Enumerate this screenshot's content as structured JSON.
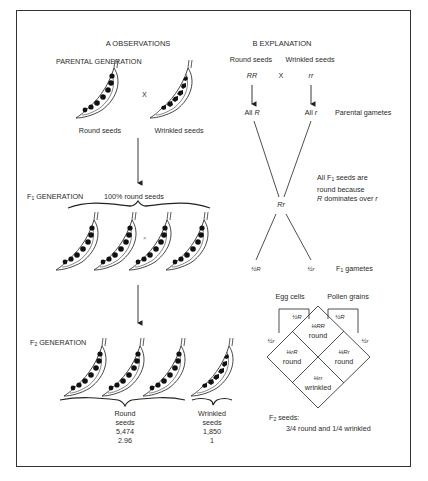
{
  "panel_a": {
    "title": "A   OBSERVATIONS",
    "parental_generation": "PARENTAL GENERATION",
    "cross_symbol": "X",
    "parent_left_label": "Round seeds",
    "parent_right_label": "Wrinkled seeds",
    "f1_label_prefix": "F",
    "f1_label_sub": "1",
    "f1_label_suffix": " GENERATION",
    "f1_note": "100% round seeds",
    "f1_cross_symbol": "×",
    "f2_label_prefix": "F",
    "f2_label_sub": "2",
    "f2_label_suffix": " GENERATION",
    "f2_round": {
      "line1": "Round",
      "line2": "seeds",
      "count": "5,474",
      "ratio": "2.96"
    },
    "f2_wrinkled": {
      "line1": "Wrinkled",
      "line2": "seeds",
      "count": "1,850",
      "ratio": "1"
    }
  },
  "panel_b": {
    "title": "B   EXPLANATION",
    "parent_left_label": "Round seeds",
    "parent_right_label": "Wrinkled seeds",
    "genotype_left": "RR",
    "cross_symbol": "X",
    "genotype_right": "rr",
    "gamete_left_prefix": "All ",
    "gamete_left_allele": "R",
    "gamete_right_prefix": "All ",
    "gamete_right_allele": "r",
    "parental_gametes": "Parental gametes",
    "f1_genotype": "Rr",
    "note_line1_prefix": "All F",
    "note_line1_sub": "1",
    "note_line1_suffix": " seeds are",
    "note_line2": "round because",
    "note_line3_allele1": "R",
    "note_line3_middle": " dominates over ",
    "note_line3_allele2": "r",
    "f1_gamete_left": "½R",
    "f1_gamete_right": "½r",
    "f1_gametes_prefix": "F",
    "f1_gametes_sub": "1",
    "f1_gametes_suffix": " gametes",
    "punnett": {
      "egg_cells": "Egg cells",
      "pollen_grains": "Pollen grains",
      "egg_R": "½R",
      "egg_r": "½r",
      "pollen_R": "½R",
      "pollen_r": "½r",
      "cells": [
        {
          "genotype": "¼RR",
          "phenotype": "round"
        },
        {
          "genotype": "¼rR",
          "phenotype": "round"
        },
        {
          "genotype": "¼Rr",
          "phenotype": "round"
        },
        {
          "genotype": "¼rr",
          "phenotype": "wrinkled"
        }
      ]
    },
    "f2_seeds_prefix": "F",
    "f2_seeds_sub": "2",
    "f2_seeds_suffix": " seeds:",
    "f2_summary": "3/4 round and 1/4 wrinkled"
  },
  "colors": {
    "ink": "#222222",
    "frame": "#333333",
    "background": "#ffffff"
  }
}
